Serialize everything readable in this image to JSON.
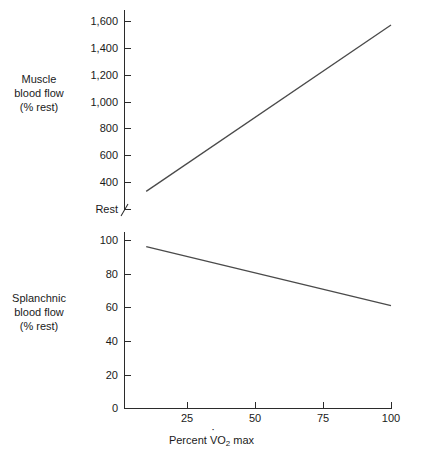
{
  "chart_data": {
    "type": "line",
    "title": "",
    "xlabel": "Percent V̇O2 max",
    "xlabel_parts": {
      "prefix": "Percent ",
      "vdot": "V",
      "o": "O",
      "sub": "2",
      "suffix": " max"
    },
    "xlim": [
      0,
      108
    ],
    "xticks": [
      25,
      50,
      75,
      100
    ],
    "xtick_labels": [
      "25",
      "50",
      "75",
      "100"
    ],
    "grid": false,
    "legend": "none",
    "panels": [
      {
        "id": "muscle",
        "ylabel": "Muscle blood flow (% rest)",
        "ylabel_lines": [
          "Muscle",
          "blood flow",
          "(% rest)"
        ],
        "ylim": [
          0,
          1700
        ],
        "yticks": [
          400,
          600,
          800,
          1000,
          1200,
          1400,
          1600
        ],
        "ytick_labels": [
          "400",
          "600",
          "800",
          "1,000",
          "1,200",
          "1,400",
          "1,600"
        ],
        "baseline_label": "Rest",
        "axis_break": true,
        "series": [
          {
            "name": "Muscle blood flow",
            "color": "#4a4a4a",
            "x": [
              10,
              100
            ],
            "y": [
              330,
              1570
            ]
          }
        ]
      },
      {
        "id": "splanchnic",
        "ylabel": "Splanchnic blood flow (% rest)",
        "ylabel_lines": [
          "Splanchnic",
          "blood flow",
          "(% rest)"
        ],
        "ylim": [
          0,
          108
        ],
        "yticks": [
          0,
          20,
          40,
          60,
          80,
          100
        ],
        "ytick_labels": [
          "0",
          "20",
          "40",
          "60",
          "80",
          "100"
        ],
        "series": [
          {
            "name": "Splanchnic blood flow",
            "color": "#4a4a4a",
            "x": [
              10,
              100
            ],
            "y": [
              96,
              61
            ]
          }
        ]
      }
    ]
  },
  "muscle_panel": {
    "label_l1": "Muscle",
    "label_l2": "blood flow",
    "label_l3": "(% rest)",
    "t1600": "1,600",
    "t1400": "1,400",
    "t1200": "1,200",
    "t1000": "1,000",
    "t800": "800",
    "t600": "600",
    "t400": "400",
    "trest": "Rest"
  },
  "splanchnic_panel": {
    "label_l1": "Splanchnic",
    "label_l2": "blood flow",
    "label_l3": "(% rest)",
    "t100": "100",
    "t80": "80",
    "t60": "60",
    "t40": "40",
    "t20": "20",
    "t0": "0"
  },
  "xaxis": {
    "t25": "25",
    "t50": "50",
    "t75": "75",
    "t100": "100",
    "title_prefix": "Percent ",
    "title_v": "V",
    "title_o": "O",
    "title_sub": "2",
    "title_suffix": " max"
  },
  "colors": {
    "line": "#4a4a4a",
    "axis": "#2b2b2b",
    "text": "#1a1a1a",
    "background": "#ffffff"
  }
}
